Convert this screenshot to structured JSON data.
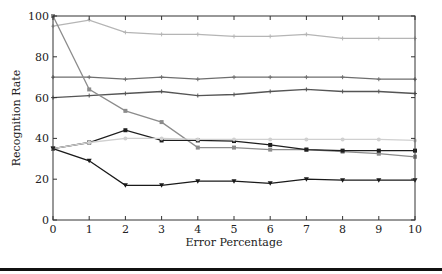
{
  "chart_data": {
    "type": "line",
    "title": "",
    "xlabel": "Error Percentage",
    "ylabel": "Recognition Rate",
    "x": [
      0,
      1,
      2,
      3,
      4,
      5,
      6,
      7,
      8,
      9,
      10
    ],
    "xlim": [
      0,
      10
    ],
    "ylim": [
      0,
      100
    ],
    "xticks": [
      "0",
      "1",
      "2",
      "3",
      "4",
      "5",
      "6",
      "7",
      "8",
      "9",
      "10"
    ],
    "yticks": [
      "0",
      "20",
      "40",
      "60",
      "80",
      "100"
    ],
    "grid": false,
    "legend": "none",
    "series": [
      {
        "name": "series-1",
        "color": "#b5b5b5",
        "marker": "plus",
        "values": [
          95,
          98,
          92,
          91,
          91,
          90,
          90,
          91,
          89,
          89,
          89
        ]
      },
      {
        "name": "series-2",
        "color": "#6e6e6e",
        "marker": "plus",
        "values": [
          70,
          70,
          69,
          70,
          69,
          70,
          70,
          70,
          70,
          69,
          69
        ]
      },
      {
        "name": "series-3",
        "color": "#555555",
        "marker": "plus",
        "values": [
          60,
          61,
          62,
          63,
          61,
          61.5,
          63,
          64,
          63,
          63,
          62
        ]
      },
      {
        "name": "series-4",
        "color": "#8c8c8c",
        "marker": "square",
        "values": [
          100,
          64,
          53.5,
          48,
          35.5,
          35.5,
          34.5,
          34.5,
          33.5,
          32.5,
          31
        ]
      },
      {
        "name": "series-5",
        "color": "#1e1e1e",
        "marker": "square",
        "values": [
          35,
          38,
          44,
          39,
          39,
          38.7,
          36.8,
          34.5,
          34,
          34,
          34
        ]
      },
      {
        "name": "series-6",
        "color": "#d0d0d0",
        "marker": "circle",
        "values": [
          35,
          38,
          40,
          40,
          39.5,
          39.5,
          39.5,
          39.5,
          39.5,
          39.5,
          39
        ]
      },
      {
        "name": "series-7",
        "color": "#1a1a1a",
        "marker": "triangle-down",
        "values": [
          35,
          29,
          17,
          17,
          19,
          19,
          18,
          20,
          19.5,
          19.5,
          19.5
        ]
      }
    ]
  }
}
